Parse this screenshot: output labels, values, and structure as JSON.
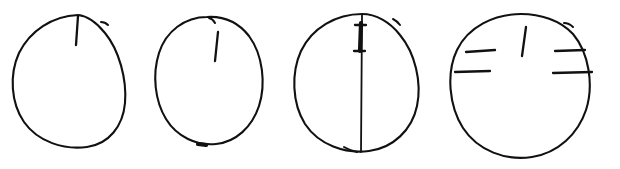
{
  "image": {
    "title": "Hand-drawn clock-face outlines with tick marks",
    "width": 620,
    "height": 169,
    "background_color": "#ffffff",
    "ink_color": "#111111",
    "medium": "black pen line drawing",
    "figure_count": 4
  },
  "figures": [
    {
      "id": "figure-1",
      "name": "oval-with-single-top-tick",
      "index_label": "1",
      "description": "Hand-drawn oval with one short vertical tick descending from the top rim",
      "bounds": {
        "x": 12,
        "y": 15,
        "width": 113,
        "height": 133
      },
      "center": {
        "x": 68,
        "y": 82
      },
      "tick_count": 1,
      "marks": [
        {
          "name": "top-tick",
          "orientation": "vertical",
          "attached_to_rim": true,
          "x1": 78,
          "y1": 16,
          "x2": 76,
          "y2": 45,
          "weight": "medium"
        },
        {
          "name": "rim-overshoot-upper-right",
          "orientation": "diagonal",
          "attached_to_rim": true,
          "x1": 101,
          "y1": 22,
          "x2": 108,
          "y2": 25,
          "weight": "thin"
        }
      ],
      "outline_path": "M 78 15 C 52 16 30 31 19 53 C 9 75 11 103 24 122 C 38 142 64 150 87 147 C 109 144 123 126 125 103 C 127 79 119 50 105 33 C 97 23 88 16 78 15 Z"
    },
    {
      "id": "figure-2",
      "name": "oval-with-detached-top-tick",
      "index_label": "2",
      "description": "Smaller hand-drawn oval with a short vertical tick floating just below the top rim and a small notch at the bottom",
      "bounds": {
        "x": 155,
        "y": 16,
        "width": 110,
        "height": 130
      },
      "center": {
        "x": 210,
        "y": 81
      },
      "tick_count": 1,
      "marks": [
        {
          "name": "top-tick",
          "orientation": "vertical",
          "attached_to_rim": false,
          "x1": 218,
          "y1": 32,
          "x2": 215,
          "y2": 61,
          "weight": "medium"
        },
        {
          "name": "rim-notch-top",
          "orientation": "diagonal",
          "attached_to_rim": true,
          "x1": 210,
          "y1": 18,
          "x2": 215,
          "y2": 22,
          "weight": "thin"
        },
        {
          "name": "rim-notch-bottom",
          "orientation": "horizontal",
          "attached_to_rim": true,
          "x1": 198,
          "y1": 144,
          "x2": 206,
          "y2": 145,
          "weight": "bold"
        }
      ],
      "outline_path": "M 207 17 C 185 17 166 31 159 53 C 152 75 155 101 166 119 C 177 137 197 146 216 144 C 236 142 252 127 259 106 C 266 84 263 55 249 36 C 238 22 223 16 207 17 Z"
    },
    {
      "id": "figure-3",
      "name": "oval-with-full-vertical-diameter",
      "index_label": "3",
      "description": "Hand-drawn oval bisected by a full vertical line from top rim to bottom rim, with a bold upper segment capped by two short horizontal ticks",
      "bounds": {
        "x": 293,
        "y": 14,
        "width": 127,
        "height": 138
      },
      "center": {
        "x": 356,
        "y": 83
      },
      "tick_count": 3,
      "marks": [
        {
          "name": "vertical-diameter",
          "orientation": "vertical",
          "attached_to_rim": true,
          "x1": 362,
          "y1": 15,
          "x2": 361,
          "y2": 152,
          "weight": "thin"
        },
        {
          "name": "bold-upper-segment",
          "orientation": "vertical",
          "attached_to_rim": false,
          "x1": 361,
          "y1": 23,
          "x2": 360,
          "y2": 51,
          "weight": "bold"
        },
        {
          "name": "cap-tick-upper",
          "orientation": "horizontal",
          "attached_to_rim": false,
          "x1": 355,
          "y1": 25,
          "x2": 366,
          "y2": 25,
          "weight": "medium"
        },
        {
          "name": "cap-tick-lower",
          "orientation": "horizontal",
          "attached_to_rim": false,
          "x1": 354,
          "y1": 51,
          "x2": 365,
          "y2": 51,
          "weight": "medium"
        },
        {
          "name": "rim-overshoot-upper-right",
          "orientation": "diagonal",
          "attached_to_rim": true,
          "x1": 394,
          "y1": 20,
          "x2": 400,
          "y2": 24,
          "weight": "thin"
        },
        {
          "name": "rim-notch-bottom-left",
          "orientation": "diagonal",
          "attached_to_rim": true,
          "x1": 345,
          "y1": 148,
          "x2": 356,
          "y2": 152,
          "weight": "thin"
        }
      ],
      "outline_path": "M 362 14 C 336 14 312 28 301 51 C 291 73 292 103 305 124 C 319 145 345 154 369 151 C 393 148 412 130 417 106 C 422 82 415 53 400 35 C 390 22 376 14 362 14 Z"
    },
    {
      "id": "figure-4",
      "name": "oval-with-four-hour-ticks",
      "index_label": "4",
      "description": "Hand-drawn oval with a detached vertical tick at the top and four horizontal ticks, two on the left inner rim and two on the right crossing the rim",
      "bounds": {
        "x": 449,
        "y": 14,
        "width": 141,
        "height": 144
      },
      "center": {
        "x": 519,
        "y": 86
      },
      "tick_count": 5,
      "marks": [
        {
          "name": "top-tick",
          "orientation": "vertical",
          "attached_to_rim": false,
          "x1": 526,
          "y1": 27,
          "x2": 522,
          "y2": 56,
          "weight": "medium"
        },
        {
          "name": "left-tick-upper",
          "orientation": "horizontal",
          "attached_to_rim": true,
          "x1": 466,
          "y1": 52,
          "x2": 495,
          "y2": 50,
          "weight": "medium"
        },
        {
          "name": "left-tick-lower",
          "orientation": "horizontal",
          "attached_to_rim": true,
          "x1": 455,
          "y1": 72,
          "x2": 490,
          "y2": 71,
          "weight": "medium"
        },
        {
          "name": "right-tick-upper",
          "orientation": "horizontal",
          "attached_to_rim": true,
          "x1": 555,
          "y1": 51,
          "x2": 585,
          "y2": 50,
          "weight": "medium"
        },
        {
          "name": "right-tick-lower",
          "orientation": "horizontal",
          "attached_to_rim": true,
          "x1": 553,
          "y1": 73,
          "x2": 592,
          "y2": 72,
          "weight": "medium"
        },
        {
          "name": "rim-overshoot-upper-right",
          "orientation": "diagonal",
          "attached_to_rim": true,
          "x1": 565,
          "y1": 23,
          "x2": 573,
          "y2": 26,
          "weight": "thin"
        }
      ],
      "outline_path": "M 521 14 C 494 14 468 27 457 50 C 446 73 449 106 463 128 C 478 151 506 161 532 157 C 558 153 578 134 586 110 C 594 85 589 53 573 34 C 560 20 540 14 521 14 Z"
    }
  ]
}
